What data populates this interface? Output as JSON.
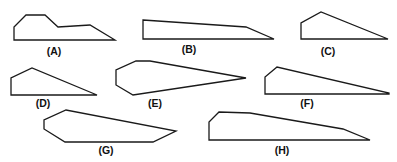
{
  "figure": {
    "shapes": [
      {
        "id": "A",
        "label": "(A)"
      },
      {
        "id": "B",
        "label": "(B)"
      },
      {
        "id": "C",
        "label": "(C)"
      },
      {
        "id": "D",
        "label": "(D)"
      },
      {
        "id": "E",
        "label": "(E)"
      },
      {
        "id": "F",
        "label": "(F)"
      },
      {
        "id": "G",
        "label": "(G)"
      },
      {
        "id": "H",
        "label": "(H)"
      }
    ]
  }
}
